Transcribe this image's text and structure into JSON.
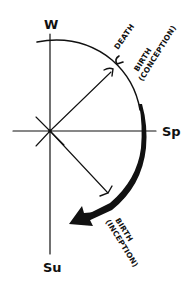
{
  "diagram": {
    "axes": {
      "top_label": "W",
      "right_label": "Sp",
      "bottom_label": "Su"
    },
    "annotations": {
      "death": "DEATH",
      "birth_conception_line1": "BIRTH",
      "birth_conception_line2": "(CONCEPTION)",
      "birth_inception_line1": "BIRTH",
      "birth_inception_line2": "(INCEPTION)"
    },
    "colors": {
      "ink": "#111111",
      "background": "#ffffff"
    }
  }
}
